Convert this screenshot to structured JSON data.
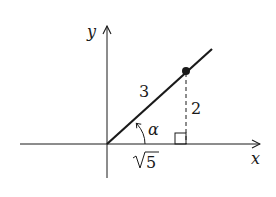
{
  "diagram": {
    "axes": {
      "x_label": "x",
      "y_label": "y"
    },
    "triangle": {
      "hypotenuse_label": "3",
      "opposite_label": "2",
      "adjacent_label": "5",
      "adjacent_radical": "√",
      "angle_label": "α"
    },
    "colors": {
      "stroke": "#1a1a1a",
      "background": "#ffffff"
    }
  }
}
